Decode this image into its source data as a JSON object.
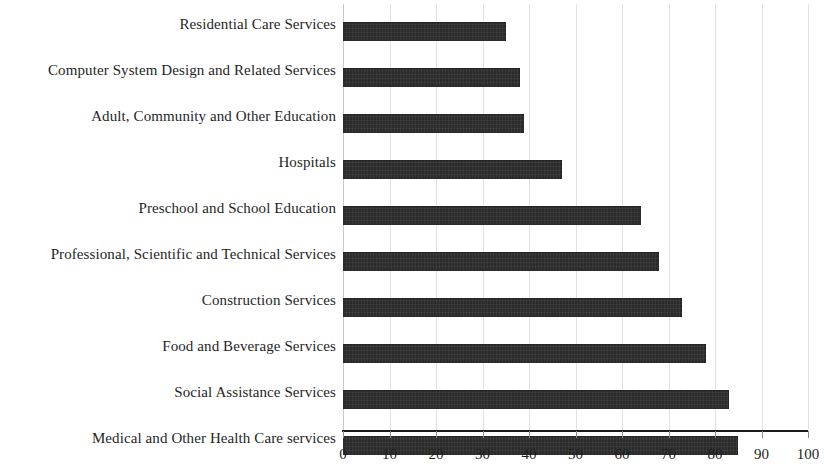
{
  "chart_data": {
    "type": "bar",
    "orientation": "horizontal",
    "title": "",
    "subtitle": "",
    "xlabel": "",
    "ylabel": "",
    "xlim": [
      0,
      100
    ],
    "ylim": null,
    "grid": true,
    "legend": null,
    "legend_position": "none",
    "xticks": [
      0,
      10,
      20,
      30,
      40,
      50,
      60,
      70,
      80,
      90,
      100
    ],
    "xtick_labels": [
      "0",
      "10",
      "20",
      "30",
      "40",
      "50",
      "60",
      "70",
      "80",
      "90",
      "100"
    ],
    "bar_color": "#2b2b2b",
    "background_color": "#ffffff",
    "grid_color": "#e2e2e2",
    "categories": [
      "Residential Care Services",
      "Computer System Design and Related Services",
      "Adult, Community and Other Education",
      "Hospitals",
      "Preschool and School Education",
      "Professional, Scientific and Technical Services",
      "Construction Services",
      "Food and Beverage Services",
      "Social Assistance Services",
      "Medical and Other Health Care services"
    ],
    "values": [
      35,
      38,
      39,
      47,
      64,
      68,
      73,
      78,
      83,
      85
    ]
  }
}
